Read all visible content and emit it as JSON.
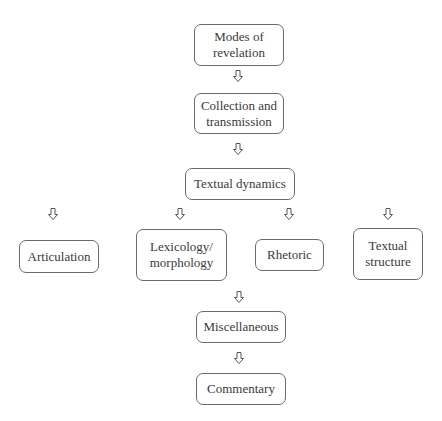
{
  "diagram": {
    "type": "flowchart",
    "nodes": [
      {
        "id": "modes",
        "label": "Modes of revelation",
        "lines": [
          "Modes of",
          "revelation"
        ]
      },
      {
        "id": "collection",
        "label": "Collection and transmission",
        "lines": [
          "Collection and",
          "transmission"
        ]
      },
      {
        "id": "dynamics",
        "label": "Textual dynamics",
        "lines": [
          "Textual dynamics"
        ]
      },
      {
        "id": "articulation",
        "label": "Articulation",
        "lines": [
          "Articulation"
        ]
      },
      {
        "id": "lexicology",
        "label": "Lexicology/ morphology",
        "lines": [
          "Lexicology/",
          "morphology"
        ]
      },
      {
        "id": "rhetoric",
        "label": "Rhetoric",
        "lines": [
          "Rhetoric"
        ]
      },
      {
        "id": "structure",
        "label": "Textual structure",
        "lines": [
          "Textual",
          "structure"
        ]
      },
      {
        "id": "misc",
        "label": "Miscellaneous",
        "lines": [
          "Miscellaneous"
        ]
      },
      {
        "id": "commentary",
        "label": "Commentary",
        "lines": [
          "Commentary"
        ]
      }
    ],
    "edges": [
      {
        "from": "modes",
        "to": "collection"
      },
      {
        "from": "collection",
        "to": "dynamics"
      },
      {
        "from": "dynamics",
        "to": "articulation"
      },
      {
        "from": "dynamics",
        "to": "lexicology"
      },
      {
        "from": "dynamics",
        "to": "rhetoric"
      },
      {
        "from": "dynamics",
        "to": "structure"
      },
      {
        "from": "lexicology",
        "to": "misc"
      },
      {
        "from": "misc",
        "to": "commentary"
      }
    ],
    "arrow_icon": "hollow-down-arrow",
    "colors": {
      "border": "#6b6b6b",
      "text": "#3a3a3a",
      "background": "#ffffff"
    }
  }
}
